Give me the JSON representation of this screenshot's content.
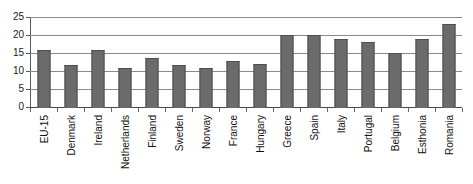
{
  "chart_data": {
    "type": "bar",
    "title": "",
    "subtitle": "",
    "xlabel": "",
    "ylabel": "",
    "ylim": [
      0,
      25
    ],
    "yticks": [
      0,
      5,
      10,
      15,
      20,
      25
    ],
    "ytick_labels": [
      "0",
      "5",
      "10",
      "15",
      "20",
      "25"
    ],
    "grid": true,
    "legend": false,
    "legend_position": "none",
    "bar_color": "#6b6b6b",
    "bar_edge_color": "#4f4f4f",
    "gridline_color": "#8a8a8a",
    "axis_color": "#5a5a5a",
    "categories": [
      "EU-15",
      "Denmark",
      "Ireland",
      "Netherlands",
      "Finland",
      "Sweden",
      "Norway",
      "France",
      "Hungary",
      "Greece",
      "Spain",
      "Italy",
      "Portugal",
      "Belgium",
      "Esthonia",
      "Romania"
    ],
    "values": [
      16,
      12,
      16,
      11,
      14,
      12,
      11,
      13,
      12.3,
      20.2,
      20.2,
      19.3,
      18.3,
      15.3,
      19.3,
      23.3
    ]
  }
}
